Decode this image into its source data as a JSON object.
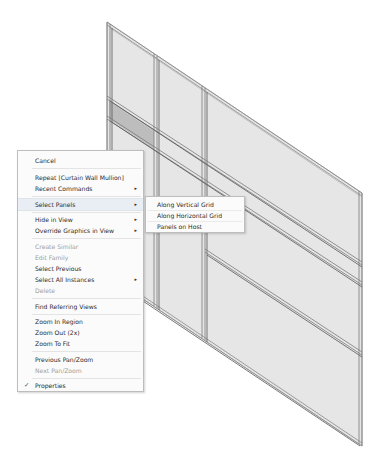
{
  "viewport": {
    "background": "#ffffff",
    "model": "curtain-wall-3d-view",
    "selected_panel_color": "#bdbdbd",
    "panel_color": "#e8e8e8",
    "mullion_color": "#8a8a8a"
  },
  "context_menu": {
    "items": [
      {
        "label": "Cancel",
        "state": "enabled"
      },
      {
        "label": "Repeat [Curtain Wall Mullion]",
        "state": "enabled"
      },
      {
        "label": "Recent Commands",
        "state": "enabled",
        "submenu": true
      },
      {
        "label": "Select Panels",
        "state": "hover",
        "submenu": true
      },
      {
        "label": "Hide in View",
        "state": "enabled",
        "submenu": true
      },
      {
        "label": "Override Graphics in View",
        "state": "enabled",
        "submenu": true
      },
      {
        "label": "Create Similar",
        "state": "disabled"
      },
      {
        "label": "Edit Family",
        "state": "disabled"
      },
      {
        "label": "Select Previous",
        "state": "enabled"
      },
      {
        "label": "Select All Instances",
        "state": "enabled",
        "submenu": true
      },
      {
        "label": "Delete",
        "state": "disabled"
      },
      {
        "label": "Find Referring Views",
        "state": "enabled"
      },
      {
        "label": "Zoom In Region",
        "state": "enabled"
      },
      {
        "label": "Zoom Out (2x)",
        "state": "enabled"
      },
      {
        "label": "Zoom To Fit",
        "state": "enabled"
      },
      {
        "label": "Previous Pan/Zoom",
        "state": "enabled"
      },
      {
        "label": "Next Pan/Zoom",
        "state": "disabled"
      },
      {
        "label": "Properties",
        "state": "checked"
      }
    ],
    "submenu_arrow": "▸",
    "check_glyph": "✓"
  },
  "submenu": {
    "parent": "Select Panels",
    "items": [
      {
        "label": "Along Vertical Grid"
      },
      {
        "label": "Along Horizontal Grid"
      },
      {
        "label": "Panels on Host"
      }
    ]
  }
}
